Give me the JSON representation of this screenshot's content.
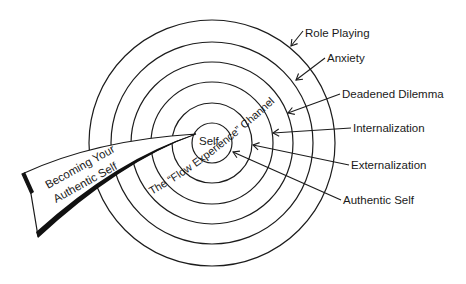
{
  "diagram": {
    "center": {
      "x": 212,
      "y": 143
    },
    "rings": [
      {
        "name": "role-playing",
        "r": 123
      },
      {
        "name": "anxiety",
        "r": 101
      },
      {
        "name": "deadened-dilemma",
        "r": 81
      },
      {
        "name": "internalization",
        "r": 61
      },
      {
        "name": "externalization",
        "r": 40
      },
      {
        "name": "authentic-self",
        "r": 20
      }
    ],
    "center_label": "Self",
    "channel_label": "The “Flow Experience” Channel",
    "banner": {
      "line1": "Becoming Your",
      "line2": "Authentic Self"
    },
    "labels": [
      {
        "text": "Role Playing",
        "x": 305,
        "y": 37,
        "tip_x": 291,
        "tip_y": 46,
        "from_x": 303,
        "from_y": 31
      },
      {
        "text": "Anxiety",
        "x": 327,
        "y": 62,
        "tip_x": 296,
        "tip_y": 80,
        "from_x": 325,
        "from_y": 58
      },
      {
        "text": "Deadened Dilemma",
        "x": 342,
        "y": 98,
        "tip_x": 288,
        "tip_y": 113,
        "from_x": 340,
        "from_y": 94
      },
      {
        "text": "Internalization",
        "x": 353,
        "y": 132,
        "tip_x": 273,
        "tip_y": 133,
        "from_x": 351,
        "from_y": 128
      },
      {
        "text": "Externalization",
        "x": 351,
        "y": 169,
        "tip_x": 253,
        "tip_y": 145,
        "from_x": 349,
        "from_y": 165
      },
      {
        "text": "Authentic Self",
        "x": 343,
        "y": 204,
        "tip_x": 233,
        "tip_y": 152,
        "from_x": 341,
        "from_y": 200
      }
    ]
  }
}
